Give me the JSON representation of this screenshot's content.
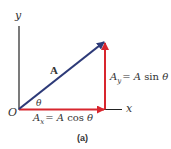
{
  "figure": {
    "caption": "(a)",
    "colors": {
      "axis": "#222222",
      "vector_A": "#2d3a78",
      "components": "#d8262e",
      "text": "#333333"
    },
    "axes": {
      "y_label": "y",
      "x_label": "x",
      "origin_label": "O"
    },
    "vector": {
      "label": "A",
      "angle_label": "θ"
    },
    "components": {
      "x": {
        "lhs_base": "A",
        "lhs_sub": "x",
        "rhs_eq": "= ",
        "rhs_A": "A",
        "rhs_fn": " cos ",
        "rhs_theta": "θ"
      },
      "y": {
        "lhs_base": "A",
        "lhs_sub": "y",
        "rhs_eq": "= ",
        "rhs_A": "A",
        "rhs_fn": " sin ",
        "rhs_theta": "θ"
      }
    }
  }
}
